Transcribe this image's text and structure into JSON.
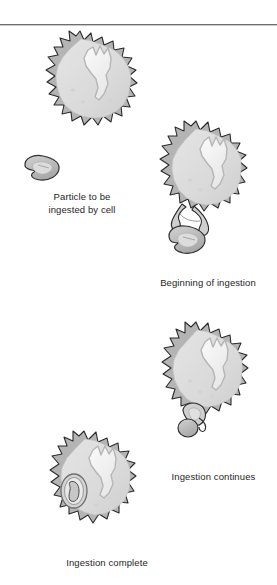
{
  "figure": {
    "width": 277,
    "height": 585,
    "background_color": "#ffffff",
    "rule_color": "#6e6e6e"
  },
  "colors": {
    "cell_outline": "#2b2b2b",
    "cell_membrane": "#b4b4b4",
    "cytoplasm": "#dcdcdc",
    "nucleus_outline": "#b0b0b0",
    "nucleus_fill": "#f2f2f2",
    "particle_fill": "#c2c2c2",
    "particle_outline": "#303030",
    "caption_text": "#1e1e1e"
  },
  "stages": [
    {
      "id": "stage-1",
      "order": 1,
      "caption": "Particle to be\ningested by cell",
      "cell_label": "amoeboid cell",
      "particle_label": "particle outside cell",
      "particle_position": "outside, below-left of cell",
      "has_free_particle": true
    },
    {
      "id": "stage-2",
      "order": 2,
      "caption": "Beginning of ingestion",
      "cell_label": "amoeboid cell extending pseudopods",
      "particle_label": "particle contacted by pseudopods",
      "particle_position": "at base of cell, surrounded by two pseudopod arms",
      "has_free_particle": false
    },
    {
      "id": "stage-3",
      "order": 3,
      "caption": "Ingestion continues",
      "cell_label": "amoeboid cell closing around particle",
      "particle_label": "particle partly enclosed",
      "particle_position": "partly enclosed at lower edge of cell",
      "has_free_particle": false
    },
    {
      "id": "stage-4",
      "order": 4,
      "caption": "Ingestion complete",
      "cell_label": "amoeboid cell with food vacuole",
      "particle_label": "particle inside food vacuole",
      "particle_position": "fully enclosed within vacuole inside cytoplasm",
      "has_free_particle": false
    }
  ]
}
